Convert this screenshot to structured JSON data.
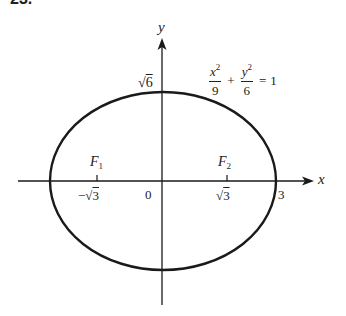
{
  "problem": {
    "number": "23."
  },
  "axes": {
    "x_label": "x",
    "y_label": "y",
    "origin_label": "0"
  },
  "equation": {
    "term1_num_var": "x",
    "term1_num_exp": "2",
    "term1_den": "9",
    "plus": "+",
    "term2_num_var": "y",
    "term2_num_exp": "2",
    "term2_den": "6",
    "equals": "=",
    "rhs": "1"
  },
  "labels": {
    "y_intercept": {
      "radical": "√",
      "radicand": "6"
    },
    "x_intercept": "3",
    "neg_focus_x": {
      "sign": "−",
      "radical": "√",
      "radicand": "3"
    },
    "pos_focus_x": {
      "radical": "√",
      "radicand": "3"
    },
    "focus1": {
      "letter": "F",
      "sub": "1"
    },
    "focus2": {
      "letter": "F",
      "sub": "2"
    }
  },
  "geometry": {
    "ellipse": {
      "a": 3,
      "b_squared": 6,
      "foci_c": "√3"
    }
  },
  "colors": {
    "stroke": "#1a1a1a",
    "background": "#ffffff"
  }
}
